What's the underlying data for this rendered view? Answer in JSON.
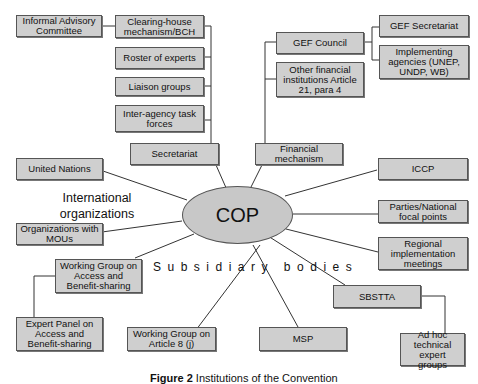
{
  "center": {
    "label": "COP"
  },
  "labels": {
    "international_organizations": "International organizations",
    "subsidiary_bodies": "Subsidiary bodies"
  },
  "boxes": {
    "informal_advisory": "Informal Advisory Committee",
    "chm": "Clearing-house mechanism/BCH",
    "roster": "Roster of experts",
    "liaison": "Liaison groups",
    "interagency": "Inter-agency task forces",
    "secretariat": "Secretariat",
    "gef_council": "GEF Council",
    "gef_secretariat": "GEF Secretariat",
    "implementing": "Implementing agencies (UNEP, UNDP, WB)",
    "other_financial": "Other financial institutions Article 21, para 4",
    "financial_mechanism": "Financial mechanism",
    "united_nations": "United Nations",
    "iccp": "ICCP",
    "parties": "Parties/National focal points",
    "mous": "Organizations with MOUs",
    "regional": "Regional implementation meetings",
    "wg_abs": "Working Group on Access and Benefit-sharing",
    "sbstta": "SBSTTA",
    "expert_panel": "Expert Panel on Access and Benefit-sharing",
    "wg_8j": "Working Group on Article 8 (j)",
    "msp": "MSP",
    "ad_hoc": "Ad hoc technical expert groups"
  },
  "caption": {
    "figure": "Figure 2",
    "text": "Institutions of the Convention"
  }
}
